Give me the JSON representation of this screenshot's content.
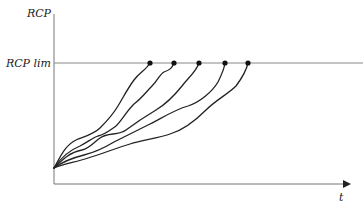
{
  "diagram": {
    "y_axis_label": "RCP",
    "limit_label": "RCP lim",
    "x_axis_label": "t",
    "colors": {
      "axis": "#777777",
      "limit_line": "#888888",
      "curves": "#222222",
      "endpoints": "#111111"
    },
    "curves": [
      {
        "name": "trajectory-1",
        "endpoint_x": 150
      },
      {
        "name": "trajectory-2",
        "endpoint_x": 174
      },
      {
        "name": "trajectory-3",
        "endpoint_x": 199
      },
      {
        "name": "trajectory-4",
        "endpoint_x": 225
      },
      {
        "name": "trajectory-5",
        "endpoint_x": 248
      }
    ],
    "curve_count": 5
  }
}
